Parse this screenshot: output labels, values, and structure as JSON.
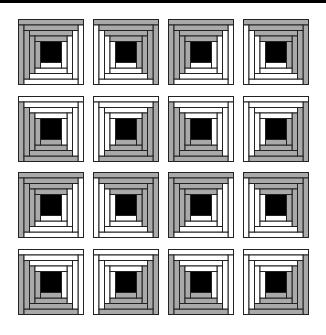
{
  "figure": {
    "rows": 4,
    "cols": 4,
    "colors": {
      "dark": "#a9a9a9",
      "light": "#ffffff",
      "center": "#000000",
      "outline": "#222222"
    },
    "block_size": 65,
    "rings": 4,
    "col_x": [
      18,
      93,
      168,
      243
    ],
    "row_y": [
      19,
      96,
      172,
      249
    ],
    "dark_corners": [
      [
        "TL",
        "TR",
        "TL",
        "TR"
      ],
      [
        "BL",
        "BR",
        "BL",
        "BR"
      ],
      [
        "TL",
        "TR",
        "TL",
        "TR"
      ],
      [
        "BL",
        "BR",
        "BL",
        "BR"
      ]
    ]
  }
}
